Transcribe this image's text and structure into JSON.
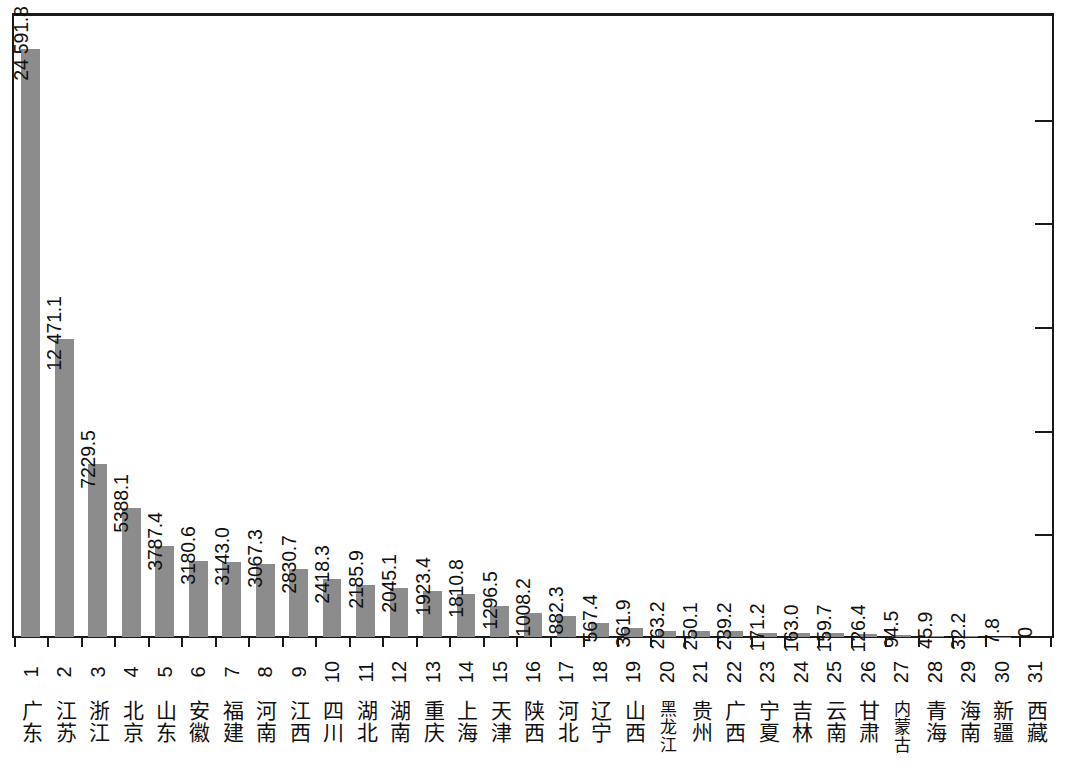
{
  "figure": {
    "title": "",
    "bar_color": "#8c8c8c",
    "axis_color": "#1a1a1a",
    "background": "#ffffff"
  },
  "chart_data": {
    "type": "bar",
    "title": "",
    "subtitle": "",
    "xlabel": "",
    "ylabel": "",
    "ylim": [
      0,
      26000
    ],
    "grid": false,
    "legend": null,
    "orientation": "vertical",
    "value_labels_rotated": true,
    "thousands_separator": " ",
    "categories": [
      "广东",
      "江苏",
      "浙江",
      "北京",
      "山东",
      "安徽",
      "福建",
      "河南",
      "江西",
      "四川",
      "湖北",
      "湖南",
      "重庆",
      "上海",
      "天津",
      "陕西",
      "河北",
      "辽宁",
      "山西",
      "黑龙江",
      "贵州",
      "广西",
      "宁夏",
      "吉林",
      "云南",
      "甘肃",
      "内蒙古",
      "青海",
      "海南",
      "新疆",
      "西藏"
    ],
    "ranks": [
      "1",
      "2",
      "3",
      "4",
      "5",
      "6",
      "7",
      "8",
      "9",
      "10",
      "11",
      "12",
      "13",
      "14",
      "15",
      "16",
      "17",
      "18",
      "19",
      "20",
      "21",
      "22",
      "23",
      "24",
      "25",
      "26",
      "27",
      "28",
      "29",
      "30",
      "31"
    ],
    "values": [
      24591.8,
      12471.1,
      7229.5,
      5388.1,
      3787.4,
      3180.6,
      3143.0,
      3067.3,
      2830.7,
      2418.3,
      2185.9,
      2045.1,
      1923.4,
      1810.8,
      1296.5,
      1008.2,
      882.3,
      567.4,
      361.9,
      263.2,
      250.1,
      239.2,
      171.2,
      163.0,
      159.7,
      126.4,
      94.5,
      45.9,
      32.2,
      7.8,
      0
    ],
    "value_labels": [
      "24 591.8",
      "12 471.1",
      "7229.5",
      "5388.1",
      "3787.4",
      "3180.6",
      "3143.0",
      "3067.3",
      "2830.7",
      "2418.3",
      "2185.9",
      "2045.1",
      "1923.4",
      "1810.8",
      "1296.5",
      "1008.2",
      "882.3",
      "567.4",
      "361.9",
      "263.2",
      "250.1",
      "239.2",
      "171.2",
      "163.0",
      "159.7",
      "126.4",
      "94.5",
      "45.9",
      "32.2",
      "7.8",
      "0"
    ],
    "right_axis_ticks": [
      5,
      4,
      3,
      2,
      1
    ],
    "right_axis_tick_labels": [
      "",
      "",
      "",
      "",
      ""
    ]
  }
}
